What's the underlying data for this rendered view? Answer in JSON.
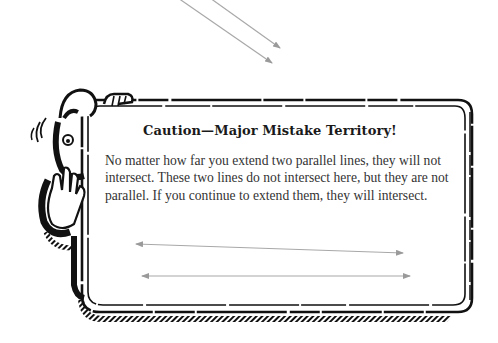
{
  "callout": {
    "title": "Caution—Major Mistake Territory!",
    "body": "No matter how far you extend two parallel lines, they will not intersect. These two lines do not intersect here, but they are not parallel. If you continue to extend them, they will intersect.",
    "icon": "cartoon-character-holding-up-hand-stop-icon"
  },
  "figures": {
    "top_lines": {
      "description": "two converging arrows pointing down-right above the box",
      "color": "#a8a8a8"
    },
    "bottom_lines": {
      "description": "two nearly-horizontal double-headed lines inside the box that are not parallel",
      "color": "#a8a8a8"
    }
  },
  "colors": {
    "frame": "#111111",
    "text": "#333333",
    "title": "#1a1a1a",
    "background": "#ffffff"
  }
}
